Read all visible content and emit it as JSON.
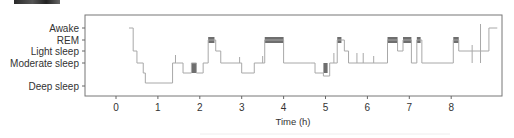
{
  "chart_data": {
    "type": "line",
    "subtype": "hypnogram (step)",
    "title": "",
    "xlabel": "Time (h)",
    "ylabel": "",
    "x_ticks": [
      0,
      1,
      2,
      3,
      4,
      5,
      6,
      7,
      8
    ],
    "xlim": [
      -0.75,
      9.2
    ],
    "y_categories": [
      "Awake",
      "REM",
      "Light sleep",
      "Moderate sleep",
      "Deep sleep"
    ],
    "grid": false,
    "legend": null,
    "colors": {
      "trace": "#a8a8a8",
      "rem_bar": "#6e6e6e",
      "axis": "#666666"
    },
    "series": [
      {
        "name": "sleep stage",
        "points": [
          {
            "t": 0.31,
            "stage": "Awake"
          },
          {
            "t": 0.41,
            "stage": "Light sleep"
          },
          {
            "t": 0.5,
            "stage": "Moderate sleep"
          },
          {
            "t": 0.65,
            "stage": "Moderate sleep-low"
          },
          {
            "t": 0.7,
            "stage": "Deep sleep"
          },
          {
            "t": 1.35,
            "stage": "Moderate sleep"
          },
          {
            "t": 1.45,
            "stage": "Moderate sleep"
          },
          {
            "t": 1.6,
            "stage": "Moderate sleep-low"
          },
          {
            "t": 1.8,
            "stage": "Moderate sleep"
          },
          {
            "t": 1.92,
            "stage": "Moderate sleep-low"
          },
          {
            "t": 2.08,
            "stage": "Moderate sleep"
          },
          {
            "t": 2.2,
            "stage": "REM"
          },
          {
            "t": 2.38,
            "stage": "Light sleep"
          },
          {
            "t": 2.5,
            "stage": "Moderate sleep"
          },
          {
            "t": 3.0,
            "stage": "Moderate sleep-low"
          },
          {
            "t": 3.3,
            "stage": "Moderate sleep"
          },
          {
            "t": 3.55,
            "stage": "REM"
          },
          {
            "t": 4.0,
            "stage": "Moderate sleep"
          },
          {
            "t": 4.65,
            "stage": "Moderate sleep"
          },
          {
            "t": 4.75,
            "stage": "Moderate sleep-low"
          },
          {
            "t": 4.95,
            "stage": "Deep sleep-high"
          },
          {
            "t": 5.1,
            "stage": "Moderate sleep"
          },
          {
            "t": 5.28,
            "stage": "REM"
          },
          {
            "t": 5.45,
            "stage": "Light sleep"
          },
          {
            "t": 5.55,
            "stage": "Moderate sleep"
          },
          {
            "t": 6.48,
            "stage": "REM"
          },
          {
            "t": 6.72,
            "stage": "Light sleep"
          },
          {
            "t": 6.85,
            "stage": "REM"
          },
          {
            "t": 7.05,
            "stage": "Moderate sleep"
          },
          {
            "t": 7.18,
            "stage": "REM"
          },
          {
            "t": 7.3,
            "stage": "Moderate sleep"
          },
          {
            "t": 8.05,
            "stage": "REM"
          },
          {
            "t": 8.18,
            "stage": "Light sleep"
          },
          {
            "t": 8.9,
            "stage": "Awake"
          },
          {
            "t": 9.1,
            "stage": "Awake"
          }
        ]
      }
    ],
    "rem_highlight_intervals_h": [
      [
        1.8,
        1.92
      ],
      [
        2.2,
        2.35
      ],
      [
        3.55,
        4.0
      ],
      [
        4.95,
        5.05
      ],
      [
        5.28,
        5.38
      ],
      [
        6.48,
        6.72
      ],
      [
        6.85,
        7.05
      ],
      [
        7.18,
        7.27
      ],
      [
        8.05,
        8.18
      ]
    ]
  },
  "axis": {
    "y_labels": [
      "Awake",
      "REM",
      "Light sleep",
      "Moderate sleep",
      "Deep sleep"
    ],
    "x_labels": [
      "0",
      "1",
      "2",
      "3",
      "4",
      "5",
      "6",
      "7",
      "8"
    ],
    "x_title": "Time (h)"
  }
}
